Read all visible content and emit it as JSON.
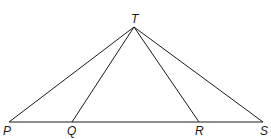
{
  "diagram": {
    "type": "triangle-with-cevians",
    "points": {
      "T": {
        "label": "T",
        "x": 134,
        "y": 27,
        "label_x": 131,
        "label_y": 23
      },
      "P": {
        "label": "P",
        "x": 9,
        "y": 122,
        "label_x": 3,
        "label_y": 135
      },
      "Q": {
        "label": "Q",
        "x": 72,
        "y": 122,
        "label_x": 67,
        "label_y": 135
      },
      "R": {
        "label": "R",
        "x": 199,
        "y": 122,
        "label_x": 195,
        "label_y": 135
      },
      "S": {
        "label": "S",
        "x": 263,
        "y": 122,
        "label_x": 260,
        "label_y": 135
      }
    },
    "segments": [
      {
        "from": "P",
        "to": "S"
      },
      {
        "from": "T",
        "to": "P"
      },
      {
        "from": "T",
        "to": "Q"
      },
      {
        "from": "T",
        "to": "R"
      },
      {
        "from": "T",
        "to": "S"
      }
    ],
    "line_color": "#1a1a1a"
  }
}
